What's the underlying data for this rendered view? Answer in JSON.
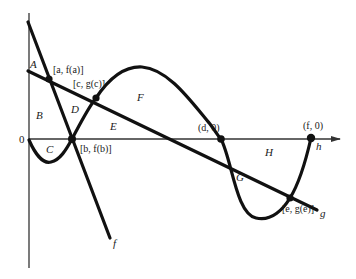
{
  "diagram": {
    "type": "area-between-curves",
    "axis": {
      "origin_label": "0"
    },
    "curves": [
      {
        "id": "f",
        "label": "f",
        "kind": "line"
      },
      {
        "id": "g",
        "label": "g",
        "kind": "line"
      },
      {
        "id": "h",
        "label": "h",
        "kind": "curve"
      }
    ],
    "points": [
      {
        "id": "a",
        "label": "[a, f(a)]"
      },
      {
        "id": "c",
        "label": "[c, g(c)]"
      },
      {
        "id": "b",
        "label": "[b, f(b)]"
      },
      {
        "id": "d",
        "label": "(d, 0)"
      },
      {
        "id": "e",
        "label": "[e, g(e)]"
      },
      {
        "id": "fpt",
        "label": "(f, 0)"
      }
    ],
    "regions": [
      "A",
      "B",
      "C",
      "D",
      "E",
      "F",
      "G",
      "H"
    ],
    "colors": {
      "ink": "#111111",
      "axis": "#333333",
      "background": "#ffffff"
    }
  }
}
